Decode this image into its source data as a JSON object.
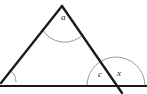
{
  "figure": {
    "type": "geometry-diagram",
    "width": 147,
    "height": 94,
    "background_color": "#ffffff",
    "stroke_color": "#1a1a1a",
    "arc_color": "#8a8a8a",
    "labels": {
      "apex_angle": "a",
      "interior_base_angle": "c",
      "exterior_base_angle": "x"
    },
    "points": {
      "apex": [
        62,
        6
      ],
      "left_vertex": [
        2,
        82
      ],
      "base_intersection": [
        116,
        86
      ],
      "transversal_end": [
        122,
        94
      ],
      "baseline_start": [
        0,
        86
      ],
      "baseline_end": [
        147,
        86
      ]
    },
    "arcs": {
      "apex_arc_radius": 26,
      "base_arc_radius": 29,
      "left_vertex_arc_radius": 14
    }
  }
}
